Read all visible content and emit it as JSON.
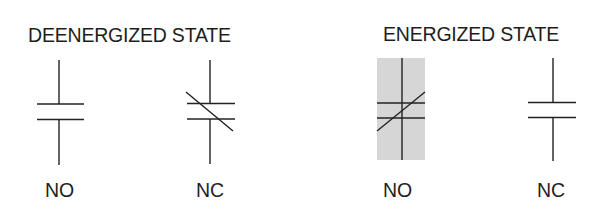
{
  "diagram": {
    "line_color": "#222222",
    "shade_color": "#d6d6d6",
    "groups": [
      {
        "title": "DEENERGIZED STATE",
        "contacts": [
          {
            "label": "NO",
            "type": "normally-open",
            "closed": false,
            "highlighted": false
          },
          {
            "label": "NC",
            "type": "normally-closed",
            "closed": true,
            "highlighted": false
          }
        ]
      },
      {
        "title": "ENERGIZED STATE",
        "contacts": [
          {
            "label": "NO",
            "type": "normally-open",
            "closed": true,
            "highlighted": true
          },
          {
            "label": "NC",
            "type": "normally-closed",
            "closed": false,
            "highlighted": false
          }
        ]
      }
    ]
  }
}
